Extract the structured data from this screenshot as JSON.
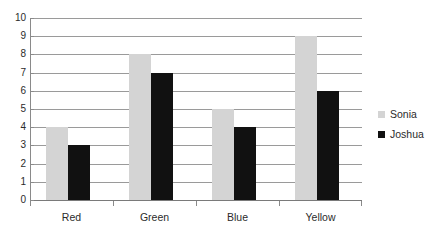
{
  "chart_data": {
    "type": "bar",
    "title": "",
    "xlabel": "",
    "ylabel": "",
    "categories": [
      "Red",
      "Green",
      "Blue",
      "Yellow"
    ],
    "series": [
      {
        "name": "Sonia",
        "color": "#d4d4d4",
        "values": [
          4,
          8,
          5,
          9
        ]
      },
      {
        "name": "Joshua",
        "color": "#111111",
        "values": [
          3,
          7,
          4,
          6
        ]
      }
    ],
    "ylim": [
      0,
      10
    ],
    "ystep": 1,
    "yticks": [
      "10",
      "9",
      "8",
      "7",
      "6",
      "5",
      "4",
      "3",
      "2",
      "1",
      "0"
    ],
    "grid": true,
    "legend_position": "right",
    "orientation": "vertical",
    "grouping": "clustered"
  },
  "legend": {
    "entries": [
      {
        "label": "Sonia",
        "swatch": "sonia-swatch-icon"
      },
      {
        "label": "Joshua",
        "swatch": "joshua-swatch-icon"
      }
    ]
  },
  "axes": {
    "y_tick_labels": [
      "10",
      "9",
      "8",
      "7",
      "6",
      "5",
      "4",
      "3",
      "2",
      "1",
      "0"
    ],
    "x_tick_labels": [
      "Red",
      "Green",
      "Blue",
      "Yellow"
    ]
  }
}
